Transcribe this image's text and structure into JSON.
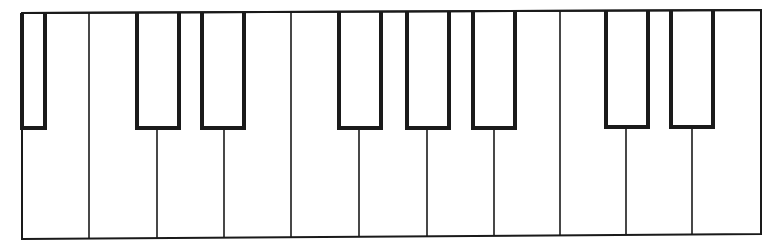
{
  "diagram": {
    "title": "",
    "type": "piano-keyboard",
    "colors": {
      "background": "#ffffff",
      "key_fill": "#ffffff",
      "line": "#1a1a1a"
    },
    "frame": {
      "left": 22,
      "right": 761,
      "top_left": 13,
      "top_right": 10,
      "bottom_left": 239,
      "bottom_right": 234
    },
    "white_key_dividers_x": [
      89,
      157,
      224,
      291,
      359,
      427,
      494,
      560,
      626,
      692
    ],
    "black_keys": [
      {
        "left": 22,
        "right": 45,
        "bottom": 128,
        "partial": true
      },
      {
        "left": 137,
        "right": 179,
        "bottom": 128
      },
      {
        "left": 202,
        "right": 244,
        "bottom": 128
      },
      {
        "left": 339,
        "right": 381,
        "bottom": 128
      },
      {
        "left": 407,
        "right": 449,
        "bottom": 128
      },
      {
        "left": 473,
        "right": 515,
        "bottom": 128
      },
      {
        "left": 606,
        "right": 648,
        "bottom": 127
      },
      {
        "left": 671,
        "right": 713,
        "bottom": 127
      }
    ],
    "white_key_count": 11,
    "black_key_count": 8,
    "labels": []
  }
}
